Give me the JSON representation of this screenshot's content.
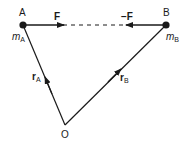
{
  "diagram": {
    "type": "vector-force-diagram",
    "colors": {
      "ink": "#1a1a1a",
      "background": "#ffffff"
    },
    "points": {
      "A": {
        "label": "A",
        "mass_label": "m",
        "mass_sub": "A"
      },
      "B": {
        "label": "B",
        "mass_label": "m",
        "mass_sub": "B"
      },
      "O": {
        "label": "O"
      }
    },
    "forces": {
      "F": {
        "label": "F"
      },
      "negF": {
        "label": "−F"
      }
    },
    "vectors": {
      "rA": {
        "label": "r",
        "sub": "A"
      },
      "rB": {
        "label": "r",
        "sub": "B"
      }
    }
  }
}
